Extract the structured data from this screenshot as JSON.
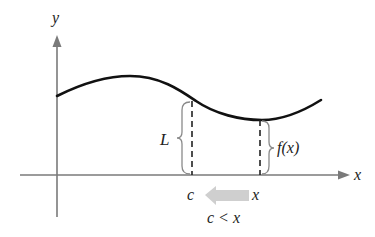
{
  "diagram": {
    "type": "function-limit-illustration",
    "axes": {
      "x_label": "x",
      "y_label": "y"
    },
    "curve": {
      "label": "f(x)",
      "color": "#111111"
    },
    "annotations": {
      "limit_label": "L",
      "value_label": "f(x)",
      "point_c_label": "c",
      "point_x_label": "x",
      "condition_label": "c < x",
      "arrow_color": "#cfcfcf",
      "arrow_direction": "left (x approaches c from the right)"
    }
  }
}
